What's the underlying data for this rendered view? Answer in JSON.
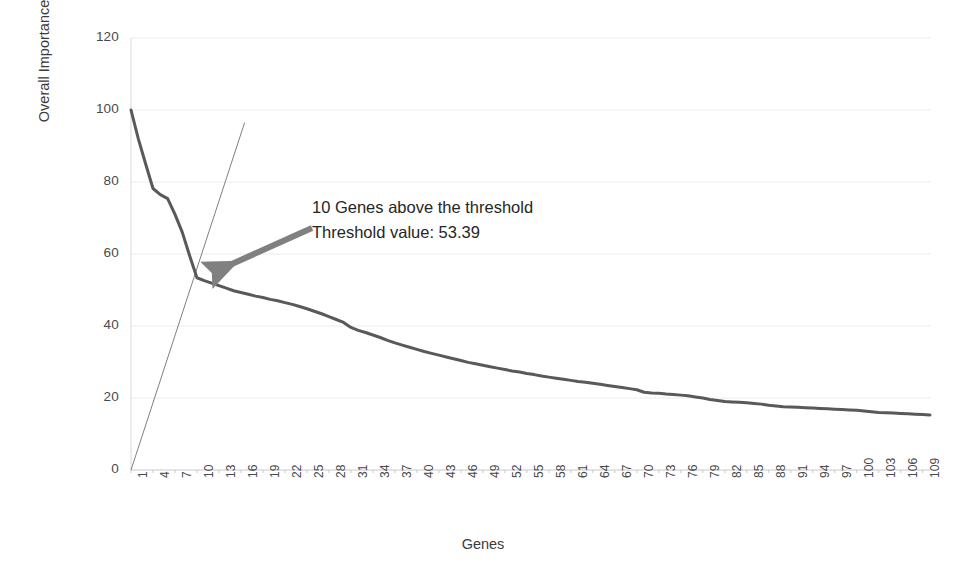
{
  "chart_data": {
    "type": "line",
    "title": "",
    "xlabel": "Genes",
    "ylabel": "Overall Importance Score",
    "xlim": [
      1,
      110
    ],
    "ylim": [
      0,
      120
    ],
    "grid": true,
    "legend": null,
    "ytick_labels": [
      "120",
      "100",
      "80",
      "60",
      "40",
      "20",
      "0"
    ],
    "ytick_values": [
      120,
      100,
      80,
      60,
      40,
      20,
      0
    ],
    "xtick_labels": [
      "1",
      "4",
      "7",
      "10",
      "13",
      "16",
      "19",
      "22",
      "25",
      "28",
      "31",
      "34",
      "37",
      "40",
      "43",
      "46",
      "49",
      "52",
      "55",
      "58",
      "61",
      "64",
      "67",
      "70",
      "73",
      "76",
      "79",
      "82",
      "85",
      "88",
      "91",
      "94",
      "97",
      "100",
      "103",
      "106",
      "109"
    ],
    "xtick_values": [
      1,
      4,
      7,
      10,
      13,
      16,
      19,
      22,
      25,
      28,
      31,
      34,
      37,
      40,
      43,
      46,
      49,
      52,
      55,
      58,
      61,
      64,
      67,
      70,
      73,
      76,
      79,
      82,
      85,
      88,
      91,
      94,
      97,
      100,
      103,
      106,
      109
    ],
    "series": [
      {
        "name": "Overall Importance Score",
        "color": "#595959",
        "x": [
          1,
          2,
          3,
          4,
          5,
          6,
          7,
          8,
          9,
          10,
          11,
          12,
          13,
          14,
          15,
          16,
          17,
          18,
          19,
          20,
          21,
          22,
          23,
          24,
          25,
          26,
          27,
          28,
          29,
          30,
          31,
          32,
          33,
          34,
          35,
          36,
          37,
          38,
          39,
          40,
          41,
          42,
          43,
          44,
          45,
          46,
          47,
          48,
          49,
          50,
          51,
          52,
          53,
          54,
          55,
          56,
          57,
          58,
          59,
          60,
          61,
          62,
          63,
          64,
          65,
          66,
          67,
          68,
          69,
          70,
          71,
          72,
          73,
          74,
          75,
          76,
          77,
          78,
          79,
          80,
          81,
          82,
          83,
          84,
          85,
          86,
          87,
          88,
          89,
          90,
          91,
          92,
          93,
          94,
          95,
          96,
          97,
          98,
          99,
          100,
          101,
          102,
          103,
          104,
          105,
          106,
          107,
          108,
          109,
          110
        ],
        "values": [
          100.0,
          92.0,
          85.0,
          78.2,
          76.5,
          75.4,
          71.0,
          66.0,
          59.5,
          53.4,
          52.6,
          51.9,
          51.2,
          50.5,
          49.8,
          49.3,
          48.8,
          48.3,
          47.9,
          47.4,
          47.0,
          46.5,
          46.0,
          45.4,
          44.8,
          44.1,
          43.4,
          42.6,
          41.8,
          41.0,
          39.6,
          38.8,
          38.2,
          37.5,
          36.8,
          36.0,
          35.3,
          34.7,
          34.1,
          33.5,
          32.9,
          32.4,
          31.9,
          31.4,
          30.9,
          30.4,
          29.9,
          29.5,
          29.1,
          28.7,
          28.3,
          27.9,
          27.5,
          27.2,
          26.8,
          26.5,
          26.1,
          25.8,
          25.5,
          25.2,
          24.9,
          24.6,
          24.4,
          24.1,
          23.8,
          23.5,
          23.2,
          22.9,
          22.6,
          22.3,
          21.6,
          21.4,
          21.3,
          21.1,
          21.0,
          20.8,
          20.6,
          20.3,
          20.0,
          19.6,
          19.3,
          19.0,
          18.9,
          18.8,
          18.7,
          18.5,
          18.3,
          18.0,
          17.8,
          17.6,
          17.5,
          17.4,
          17.3,
          17.2,
          17.1,
          17.0,
          16.9,
          16.8,
          16.7,
          16.6,
          16.4,
          16.2,
          16.0,
          15.9,
          15.8,
          15.7,
          15.6,
          15.5,
          15.4,
          15.3
        ]
      }
    ],
    "threshold_line": {
      "name": "threshold-diagonal",
      "color": "#7f7f7f",
      "x_start": 1.0,
      "y_start": 0.0,
      "x_end": 16.5,
      "y_end": 96.5,
      "crossing_x": 10,
      "crossing_y": 53.39
    },
    "annotations": [
      {
        "name": "threshold-callout",
        "line1": "10 Genes above the threshold",
        "line2": "Threshold value: 53.39",
        "arrow_from_x": 312,
        "arrow_from_y": 228,
        "arrow_to_x": 214,
        "arrow_to_y": 272,
        "arrow_color": "#808080"
      }
    ]
  },
  "axis": {
    "y_title": "Overall Importance Score",
    "x_title": "Genes"
  },
  "annotation": {
    "line1": "10 Genes above the threshold",
    "line2": "Threshold value: 53.39"
  },
  "colors": {
    "series": "#595959",
    "threshold": "#7f7f7f",
    "grid": "#e8eef2",
    "axis_text": "#4a4a4a",
    "background": "#ffffff"
  }
}
